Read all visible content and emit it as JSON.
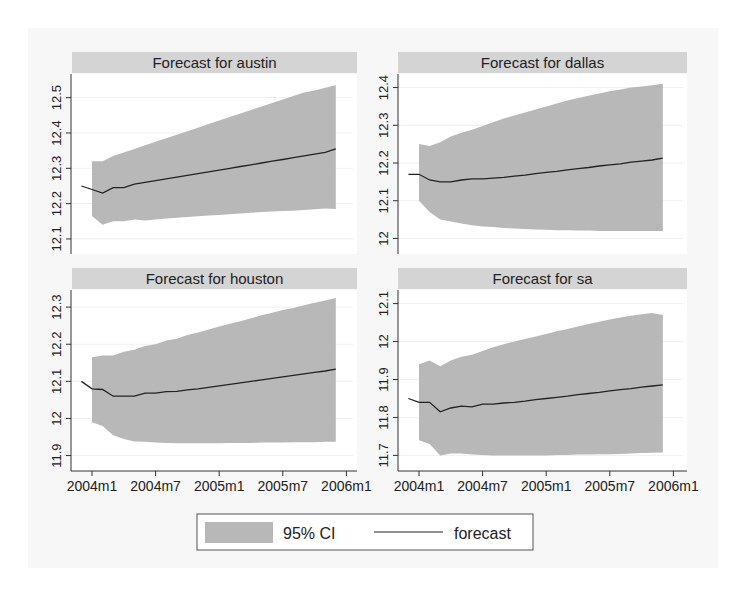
{
  "chart_data": {
    "type": "area",
    "layout": "2x2 grid of panels",
    "x_ticks": [
      "2004m1",
      "2004m7",
      "2005m1",
      "2005m7",
      "2006m1"
    ],
    "legend": {
      "position": "bottom",
      "items": [
        {
          "label": "95% CI",
          "kind": "band",
          "color": "#b8b8b8"
        },
        {
          "label": "forecast",
          "kind": "line",
          "color": "#222222"
        }
      ]
    },
    "panels": [
      {
        "title": "Forecast for austin",
        "ylim": [
          12.08,
          12.55
        ],
        "y_ticks": [
          12.1,
          12.2,
          12.3,
          12.4,
          12.5
        ],
        "x_months": [
          -1,
          0,
          1,
          2,
          3,
          4,
          5,
          6,
          7,
          8,
          9,
          10,
          11,
          12,
          13,
          14,
          15,
          16,
          17,
          18,
          19,
          20,
          21,
          22,
          23
        ],
        "forecast": [
          12.25,
          12.24,
          12.23,
          12.245,
          12.245,
          12.255,
          12.26,
          12.265,
          12.27,
          12.275,
          12.28,
          12.285,
          12.29,
          12.295,
          12.3,
          12.305,
          12.31,
          12.315,
          12.32,
          12.325,
          12.33,
          12.335,
          12.34,
          12.345,
          12.355
        ],
        "ci_lower": [
          null,
          12.165,
          12.14,
          12.15,
          12.15,
          12.155,
          12.152,
          12.155,
          12.158,
          12.16,
          12.162,
          12.164,
          12.166,
          12.168,
          12.17,
          12.172,
          12.174,
          12.176,
          12.178,
          12.179,
          12.18,
          12.182,
          12.184,
          12.186,
          12.185
        ],
        "ci_upper": [
          null,
          12.32,
          12.32,
          12.335,
          12.345,
          12.355,
          12.365,
          12.375,
          12.385,
          12.395,
          12.405,
          12.415,
          12.425,
          12.435,
          12.445,
          12.455,
          12.465,
          12.475,
          12.485,
          12.495,
          12.505,
          12.515,
          12.52,
          12.528,
          12.535
        ]
      },
      {
        "title": "Forecast for dallas",
        "ylim": [
          11.98,
          12.42
        ],
        "y_ticks": [
          12,
          12.1,
          12.2,
          12.3,
          12.4
        ],
        "x_months": [
          -1,
          0,
          1,
          2,
          3,
          4,
          5,
          6,
          7,
          8,
          9,
          10,
          11,
          12,
          13,
          14,
          15,
          16,
          17,
          18,
          19,
          20,
          21,
          22,
          23
        ],
        "forecast": [
          12.17,
          12.17,
          12.155,
          12.15,
          12.15,
          12.155,
          12.158,
          12.158,
          12.16,
          12.162,
          12.165,
          12.168,
          12.172,
          12.175,
          12.178,
          12.182,
          12.185,
          12.188,
          12.192,
          12.195,
          12.198,
          12.202,
          12.205,
          12.208,
          12.213
        ],
        "ci_lower": [
          null,
          12.1,
          12.07,
          12.05,
          12.045,
          12.04,
          12.035,
          12.032,
          12.03,
          12.028,
          12.026,
          12.025,
          12.024,
          12.023,
          12.022,
          12.022,
          12.021,
          12.021,
          12.02,
          12.02,
          12.02,
          12.02,
          12.02,
          12.02,
          12.02
        ],
        "ci_upper": [
          null,
          12.25,
          12.245,
          12.255,
          12.27,
          12.28,
          12.288,
          12.298,
          12.308,
          12.318,
          12.326,
          12.334,
          12.342,
          12.35,
          12.358,
          12.366,
          12.372,
          12.378,
          12.384,
          12.39,
          12.395,
          12.4,
          12.403,
          12.406,
          12.41
        ]
      },
      {
        "title": "Forecast for houston",
        "ylim": [
          11.88,
          12.33
        ],
        "y_ticks": [
          11.9,
          12,
          12.1,
          12.2,
          12.3
        ],
        "x_months": [
          -1,
          0,
          1,
          2,
          3,
          4,
          5,
          6,
          7,
          8,
          9,
          10,
          11,
          12,
          13,
          14,
          15,
          16,
          17,
          18,
          19,
          20,
          21,
          22,
          23
        ],
        "forecast": [
          12.1,
          12.08,
          12.078,
          12.06,
          12.06,
          12.06,
          12.068,
          12.068,
          12.072,
          12.073,
          12.077,
          12.08,
          12.084,
          12.088,
          12.092,
          12.096,
          12.1,
          12.104,
          12.108,
          12.112,
          12.116,
          12.12,
          12.124,
          12.128,
          12.133
        ],
        "ci_lower": [
          null,
          11.99,
          11.98,
          11.955,
          11.945,
          11.938,
          11.937,
          11.935,
          11.934,
          11.933,
          11.933,
          11.933,
          11.933,
          11.933,
          11.934,
          11.934,
          11.934,
          11.935,
          11.935,
          11.935,
          11.936,
          11.936,
          11.936,
          11.937,
          11.937
        ],
        "ci_upper": [
          null,
          12.165,
          12.17,
          12.17,
          12.18,
          12.185,
          12.195,
          12.2,
          12.21,
          12.215,
          12.225,
          12.232,
          12.24,
          12.248,
          12.255,
          12.262,
          12.27,
          12.278,
          12.285,
          12.292,
          12.298,
          12.305,
          12.312,
          12.318,
          12.325
        ]
      },
      {
        "title": "Forecast for sa",
        "ylim": [
          11.68,
          12.12
        ],
        "y_ticks": [
          11.7,
          11.8,
          11.9,
          12,
          12.1
        ],
        "x_months": [
          -1,
          0,
          1,
          2,
          3,
          4,
          5,
          6,
          7,
          8,
          9,
          10,
          11,
          12,
          13,
          14,
          15,
          16,
          17,
          18,
          19,
          20,
          21,
          22,
          23
        ],
        "forecast": [
          11.85,
          11.84,
          11.84,
          11.815,
          11.825,
          11.83,
          11.828,
          11.835,
          11.835,
          11.838,
          11.84,
          11.843,
          11.847,
          11.85,
          11.853,
          11.856,
          11.86,
          11.863,
          11.866,
          11.87,
          11.873,
          11.876,
          11.88,
          11.883,
          11.886
        ],
        "ci_lower": [
          null,
          11.74,
          11.73,
          11.7,
          11.705,
          11.705,
          11.702,
          11.701,
          11.7,
          11.7,
          11.7,
          11.7,
          11.7,
          11.7,
          11.701,
          11.701,
          11.702,
          11.702,
          11.703,
          11.703,
          11.704,
          11.705,
          11.706,
          11.707,
          11.708
        ],
        "ci_upper": [
          null,
          11.94,
          11.95,
          11.935,
          11.95,
          11.96,
          11.965,
          11.975,
          11.985,
          11.993,
          12.0,
          12.007,
          12.013,
          12.02,
          12.027,
          12.033,
          12.04,
          12.046,
          12.052,
          12.058,
          12.063,
          12.068,
          12.072,
          12.075,
          12.07
        ]
      }
    ]
  }
}
